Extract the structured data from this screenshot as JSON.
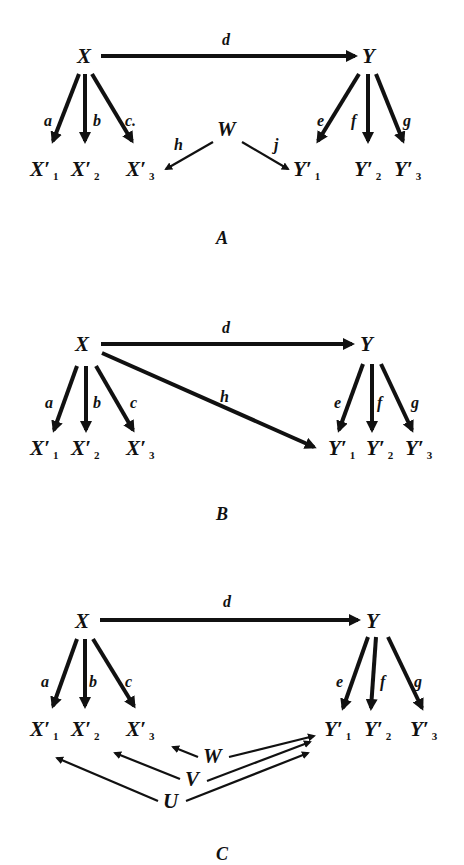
{
  "panels": [
    {
      "caption": "A",
      "nodes": {
        "X": "X",
        "Y": "Υ",
        "X1": "X′",
        "X2": "X′",
        "X3": "X′",
        "Y1": "Υ′",
        "Y2": "Υ′",
        "Y3": "Υ′",
        "W": "W"
      },
      "subscripts": [
        "1",
        "2",
        "3"
      ],
      "edges": {
        "d": "d",
        "a": "a",
        "b": "b",
        "c": "c.",
        "e": "e",
        "f": "f",
        "g": "g",
        "h": "h",
        "j": "j"
      }
    },
    {
      "caption": "B",
      "nodes": {
        "X": "X",
        "Y": "Υ",
        "X1": "X′",
        "X2": "X′",
        "X3": "X′",
        "Y1": "Υ′",
        "Y2": "Υ′",
        "Y3": "Υ′"
      },
      "subscripts": [
        "1",
        "2",
        "3"
      ],
      "edges": {
        "d": "d",
        "a": "a",
        "b": "b",
        "c": "c",
        "e": "e",
        "f": "f",
        "g": "g",
        "h": "h"
      }
    },
    {
      "caption": "C",
      "nodes": {
        "X": "X",
        "Y": "Υ",
        "X1": "X′",
        "X2": "X′",
        "X3": "X′",
        "Y1": "Υ′",
        "Y2": "Υ′",
        "Y3": "Υ′",
        "W": "W",
        "V": "V",
        "U": "U"
      },
      "subscripts": [
        "1",
        "2",
        "3"
      ],
      "edges": {
        "d": "d",
        "a": "a",
        "b": "b",
        "c": "c",
        "e": "e",
        "f": "f",
        "g": "g"
      }
    }
  ],
  "colors": {
    "ink": "#111111",
    "background": "#ffffff"
  }
}
